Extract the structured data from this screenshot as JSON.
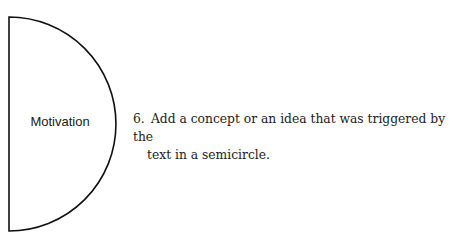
{
  "diagram": {
    "shape": "semicircle",
    "label": "Motivation",
    "stroke_color": "#111111"
  },
  "instruction": {
    "number": "6.",
    "line1": "Add a concept or an idea that was triggered by the",
    "line2": "text in a semicircle."
  }
}
